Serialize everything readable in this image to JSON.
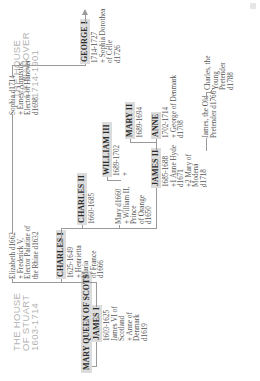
{
  "houses": {
    "hanover": {
      "lines": [
        "THE HOUSE",
        "OF HANOVER",
        "1714-1901"
      ]
    },
    "stuart": {
      "lines": [
        "THE HOUSE",
        "OF STUART",
        "1603-1714"
      ]
    }
  },
  "root": {
    "name": "MARY QUEEN OF SCOTS"
  },
  "monarchs": {
    "james_i": {
      "name": "JAMES I",
      "info": [
        "1603-1625",
        "James VI of",
        "Scotland",
        "+ Anne of",
        "Denmark",
        "d1619"
      ]
    },
    "charles_i": {
      "name": "CHARLES I",
      "info": [
        "1625-1649",
        "+ Henrietta",
        "Maria",
        "of France",
        "d1666"
      ]
    },
    "charles_ii": {
      "name": "CHARLES II",
      "info": [
        "1660-1685"
      ]
    },
    "james_ii": {
      "name": "JAMES II",
      "info": [
        "1685-1688",
        "+1 Anne Hyde",
        "d1671",
        "+2 Mary of",
        "Modena",
        "d1718"
      ]
    },
    "william_iii": {
      "name": "WILLIAM III",
      "info": [
        "1689-1702",
        "+"
      ]
    },
    "mary_ii": {
      "name": "MARY II",
      "info": [
        "1689-1694"
      ]
    },
    "anne": {
      "name": "ANNE",
      "info": [
        "1702-1714",
        "+ George of Denmark",
        "d1708"
      ]
    },
    "george_i": {
      "name": "GEORGE I",
      "info": [
        "1714-1727",
        "+ Sophia Dorothea",
        "of Celle",
        "d1726"
      ]
    }
  },
  "relatives": {
    "elizabeth": [
      "Elizabeth d1662",
      "+ Frederick V,",
      "Elector Palatine of",
      "the Rhine d1632"
    ],
    "sophia": [
      "Sophia d1714",
      "+ Ernest Augustus,",
      "Elector of Hanover",
      "d1698"
    ],
    "mary": [
      "Mary d1660",
      "+ William II,",
      "Prince",
      "of Orange",
      "d1650"
    ],
    "james_old_pretender": [
      "James, the Old",
      "Pretender d1766"
    ],
    "charles_young_pretender": [
      "Charles, the",
      "Young",
      "Pretender",
      "d1788"
    ]
  },
  "colors": {
    "box_fill": "#dcdcdc",
    "line": "#9a9a9a",
    "house_title": "#b4b4b4",
    "text": "#555555"
  }
}
